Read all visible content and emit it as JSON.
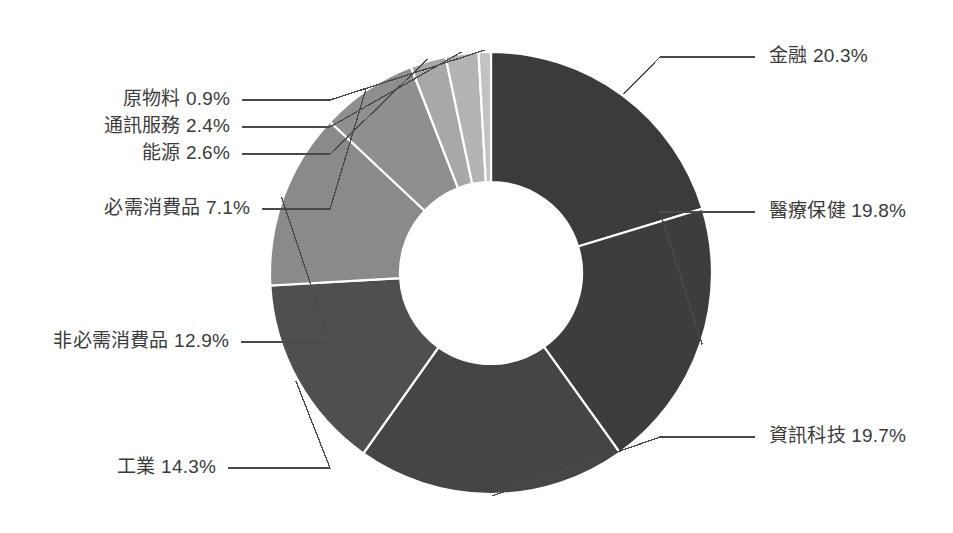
{
  "chart_data": {
    "type": "pie",
    "title": "",
    "subtitle": "",
    "xlabel": "",
    "ylabel": "",
    "legend_position": "labels-with-leader-lines",
    "grid": false,
    "donut": true,
    "inner_radius_ratio": 0.41,
    "start_angle_deg": 0,
    "direction": "clockwise",
    "units": "percent",
    "categories": [
      "金融",
      "醫療保健",
      "資訊科技",
      "工業",
      "非必需消費品",
      "必需消費品",
      "能源",
      "通訊服務",
      "原物料"
    ],
    "values": [
      20.3,
      19.8,
      19.7,
      14.3,
      12.9,
      7.1,
      2.6,
      2.4,
      0.9
    ],
    "colors": [
      "#3b3b3b",
      "#3d3d3d",
      "#454545",
      "#4f4f4f",
      "#8a8a8a",
      "#8f8f8f",
      "#a8a8a8",
      "#b4b4b4",
      "#c2c2c2"
    ],
    "slices": [
      {
        "label": "金融",
        "value": 20.3,
        "display": "金融 20.3%",
        "color": "#3b3b3b",
        "side": "right"
      },
      {
        "label": "醫療保健",
        "value": 19.8,
        "display": "醫療保健 19.8%",
        "color": "#3d3d3d",
        "side": "right"
      },
      {
        "label": "資訊科技",
        "value": 19.7,
        "display": "資訊科技 19.7%",
        "color": "#454545",
        "side": "right"
      },
      {
        "label": "工業",
        "value": 14.3,
        "display": "工業 14.3%",
        "color": "#4f4f4f",
        "side": "left"
      },
      {
        "label": "非必需消費品",
        "value": 12.9,
        "display": "非必需消費品 12.9%",
        "color": "#8a8a8a",
        "side": "left"
      },
      {
        "label": "必需消費品",
        "value": 7.1,
        "display": "必需消費品 7.1%",
        "color": "#8f8f8f",
        "side": "left"
      },
      {
        "label": "能源",
        "value": 2.6,
        "display": "能源 2.6%",
        "color": "#a8a8a8",
        "side": "left"
      },
      {
        "label": "通訊服務",
        "value": 2.4,
        "display": "通訊服務 2.4%",
        "color": "#b4b4b4",
        "side": "left"
      },
      {
        "label": "原物料",
        "value": 0.9,
        "display": "原物料 0.9%",
        "color": "#c2c2c2",
        "side": "left"
      }
    ]
  },
  "geometry": {
    "center_x": 491,
    "center_y": 273,
    "outer_radius": 221,
    "inner_radius": 91
  },
  "labels": {
    "finance": "金融 20.3%",
    "healthcare": "醫療保健 19.8%",
    "infotech": "資訊科技 19.7%",
    "industrials": "工業 14.3%",
    "consumer_discretionary": "非必需消費品 12.9%",
    "consumer_staples": "必需消費品 7.1%",
    "energy": "能源 2.6%",
    "telecom": "通訊服務 2.4%",
    "materials": "原物料 0.9%"
  }
}
